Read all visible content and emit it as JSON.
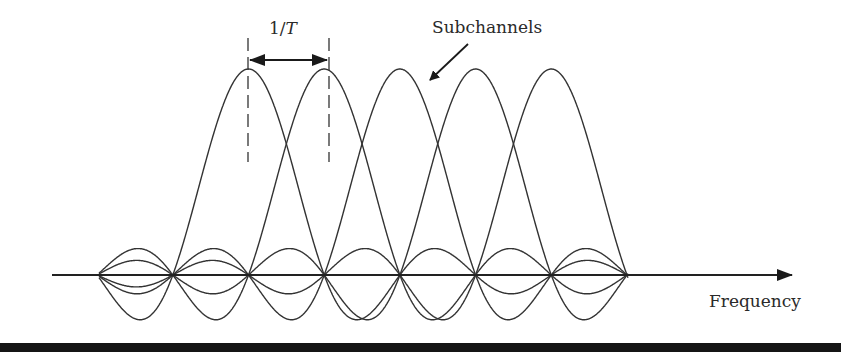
{
  "diagram": {
    "labels": {
      "subchannels": "Subchannels",
      "frequency": "Frequency",
      "spacing_num": "1/",
      "spacing_var": "T"
    },
    "colors": {
      "stroke": "#333333",
      "background": "#ffffff",
      "bottom_bar": "#151515"
    },
    "axis": {
      "x_start": 52,
      "x_end": 792,
      "y": 275
    },
    "subchannel_count": 5,
    "subchannel_spacing_px": 75.7,
    "first_peak_x": 248.5,
    "peak_height_px": 206,
    "zero_crossings_x": [
      99,
      174,
      249,
      324,
      400,
      476,
      552,
      628
    ],
    "curve_span_x": [
      99,
      628
    ],
    "dashed_markers_x": [
      248,
      329
    ],
    "spacing_arrow": {
      "x1": 248,
      "x2": 329,
      "y": 60
    }
  }
}
